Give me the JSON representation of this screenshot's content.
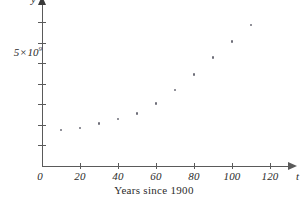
{
  "chart_data": {
    "type": "scatter",
    "title": "",
    "subtitle": "",
    "caption": "Years since 1900",
    "xlabel": "t",
    "ylabel": "y",
    "xlim": [
      0,
      130
    ],
    "ylim": [
      0,
      8000000000
    ],
    "grid": false,
    "legend": null,
    "x_ticks": [
      {
        "value": 0,
        "label": "0"
      },
      {
        "value": 20,
        "label": "20"
      },
      {
        "value": 40,
        "label": "40"
      },
      {
        "value": 60,
        "label": "60"
      },
      {
        "value": 80,
        "label": "80"
      },
      {
        "value": 100,
        "label": "100"
      },
      {
        "value": 120,
        "label": "120"
      }
    ],
    "y_ticks": [
      {
        "value": 1000000000,
        "label": ""
      },
      {
        "value": 2000000000,
        "label": ""
      },
      {
        "value": 3000000000,
        "label": ""
      },
      {
        "value": 4000000000,
        "label": ""
      },
      {
        "value": 5000000000,
        "label": "5 × 10⁹"
      },
      {
        "value": 6000000000,
        "label": ""
      },
      {
        "value": 7000000000,
        "label": ""
      }
    ],
    "y_tick_label_text": {
      "mantissa": "5",
      "times": "×",
      "base": "10",
      "exponent": "9"
    },
    "x": [
      10,
      20,
      30,
      40,
      50,
      60,
      70,
      80,
      90,
      100,
      110
    ],
    "y": [
      1750000000,
      1860000000,
      2070000000,
      2300000000,
      2560000000,
      3040000000,
      3710000000,
      4450000000,
      5280000000,
      6080000000,
      6870000000
    ],
    "points": [
      {
        "t": 10,
        "population": 1750000000
      },
      {
        "t": 20,
        "population": 1860000000
      },
      {
        "t": 30,
        "population": 2070000000
      },
      {
        "t": 40,
        "population": 2300000000
      },
      {
        "t": 50,
        "population": 2560000000
      },
      {
        "t": 60,
        "population": 3040000000
      },
      {
        "t": 70,
        "population": 3710000000
      },
      {
        "t": 80,
        "population": 4450000000
      },
      {
        "t": 90,
        "population": 5280000000
      },
      {
        "t": 100,
        "population": 6080000000
      },
      {
        "t": 110,
        "population": 6870000000
      }
    ]
  },
  "colors": {
    "axis": "#5a5a5a",
    "text": "#2b2b2b",
    "point": "#6e6e78",
    "background": "#ffffff"
  }
}
